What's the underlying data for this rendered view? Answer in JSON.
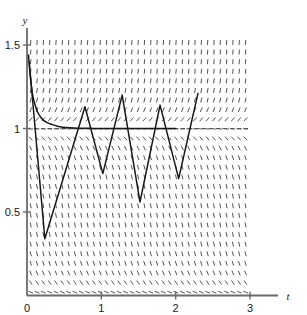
{
  "chart_data": {
    "type": "line",
    "title": "",
    "subtitle": "",
    "xlabel": "t",
    "ylabel": "y",
    "xlim": [
      0,
      3.0
    ],
    "ylim": [
      0,
      1.62
    ],
    "grid": false,
    "legend": null,
    "xticks": [
      {
        "value": 0,
        "label": "0"
      },
      {
        "value": 1,
        "label": "1"
      },
      {
        "value": 2,
        "label": "2"
      },
      {
        "value": 3,
        "label": "3"
      }
    ],
    "yticks": [
      {
        "value": 0.5,
        "label": "0.5"
      },
      {
        "value": 1.0,
        "label": "1"
      },
      {
        "value": 1.5,
        "label": "1.5"
      }
    ],
    "series": [
      {
        "name": "equilibrium-solution",
        "kind": "smooth-decay",
        "note": "solution decaying onto the equilibrium y = 1",
        "points": [
          [
            0.02,
            1.44
          ],
          [
            0.04,
            1.33
          ],
          [
            0.06,
            1.25
          ],
          [
            0.08,
            1.19
          ],
          [
            0.11,
            1.14
          ],
          [
            0.14,
            1.1
          ],
          [
            0.18,
            1.07
          ],
          [
            0.22,
            1.05
          ],
          [
            0.27,
            1.035
          ],
          [
            0.33,
            1.025
          ],
          [
            0.4,
            1.015
          ],
          [
            0.48,
            1.008
          ],
          [
            0.58,
            1.004
          ],
          [
            0.7,
            1.002
          ],
          [
            0.85,
            1.001
          ],
          [
            1.0,
            1.0
          ],
          [
            1.3,
            1.0
          ],
          [
            1.6,
            1.0
          ],
          [
            1.9,
            1.0
          ],
          [
            2.0,
            1.0
          ]
        ]
      },
      {
        "name": "zigzag-solution",
        "kind": "piecewise-linear-oscillation",
        "note": "numerically unstable solution with growing oscillation about y = 1",
        "points": [
          [
            0.03,
            1.4
          ],
          [
            0.24,
            0.34
          ],
          [
            0.78,
            1.13
          ],
          [
            1.02,
            0.73
          ],
          [
            1.28,
            1.2
          ],
          [
            1.52,
            0.56
          ],
          [
            1.79,
            1.14
          ],
          [
            2.04,
            0.7
          ],
          [
            2.3,
            1.21
          ]
        ]
      }
    ],
    "equilibrium_line": {
      "y": 1.0,
      "style": "dashed",
      "x_from": 0.0,
      "x_to": 3.0
    },
    "slope_field": {
      "description": "direction field of short dashes; near-vertical away from y = 1, flat along y = 1, tilted near y = 0",
      "t_from": 0.05,
      "t_to": 2.97,
      "t_step": 0.085,
      "y_from": 0.02,
      "y_to": 1.55,
      "y_step": 0.0575,
      "equilibria": [
        0.0,
        1.0
      ]
    }
  },
  "style": {
    "axis_color": "#6b6b6b",
    "curve_color": "#1a1a1a",
    "field_color": "#555555",
    "background": "#ffffff"
  }
}
